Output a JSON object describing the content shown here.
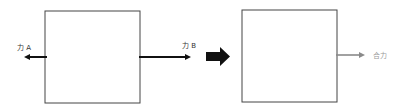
{
  "diagram": {
    "before": {
      "box": {
        "x": 45,
        "y": 11,
        "w": 95,
        "h": 92
      },
      "force_a": {
        "label": "力 A",
        "direction": "left",
        "color": "#111111"
      },
      "force_b": {
        "label": "力 B",
        "direction": "right",
        "color": "#111111"
      }
    },
    "transition_arrow": {
      "color": "#111111",
      "direction": "right"
    },
    "after": {
      "box": {
        "x": 242,
        "y": 10,
        "w": 95,
        "h": 92
      },
      "resultant": {
        "label": "合力",
        "direction": "right",
        "color": "#8a8a8a"
      }
    }
  }
}
